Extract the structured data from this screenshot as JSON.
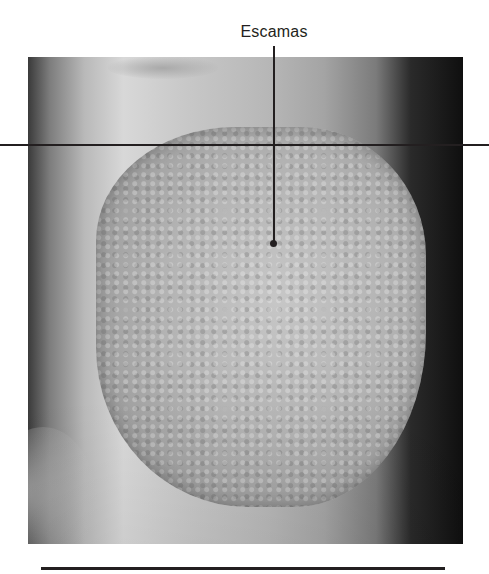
{
  "figure": {
    "label": "Escamas",
    "photo_description": "Grayscale clinical photograph of a scaly skin plaque on a limb",
    "colors": {
      "line": "#231f20",
      "background": "#ffffff"
    }
  }
}
